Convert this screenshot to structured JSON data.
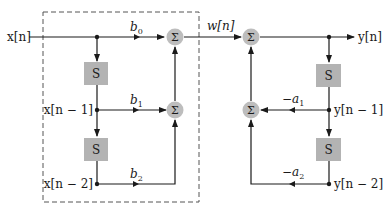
{
  "diagram": {
    "type": "direct-form-I-biquad",
    "colors": {
      "line": "#1a1a1a",
      "block_fill": "#b3b3b3",
      "sum_fill": "#bdbdbd",
      "dashed_box": "#555555"
    },
    "input": {
      "label": "x[n]"
    },
    "intermediate": {
      "label": "w[n]"
    },
    "output": {
      "label": "y[n]"
    },
    "feedforward": {
      "taps": [
        {
          "signal": "x[n]",
          "gain": "b0"
        },
        {
          "signal": "x[n − 1]",
          "gain": "b1"
        },
        {
          "signal": "x[n − 2]",
          "gain": "b2"
        }
      ],
      "delays": [
        {
          "label": "S"
        },
        {
          "label": "S"
        }
      ],
      "adders": [
        {
          "label": "Σ"
        },
        {
          "label": "Σ"
        }
      ]
    },
    "feedback": {
      "taps": [
        {
          "signal": "y[n − 1]",
          "gain": "−a1"
        },
        {
          "signal": "y[n − 2]",
          "gain": "−a2"
        }
      ],
      "delays": [
        {
          "label": "S"
        },
        {
          "label": "S"
        }
      ],
      "adders": [
        {
          "label": "Σ"
        },
        {
          "label": "Σ"
        }
      ]
    },
    "text": {
      "x_n": "x[n]",
      "x_n1": "x[n − 1]",
      "x_n2": "x[n − 2]",
      "w_n": "w[n]",
      "y_n": "y[n]",
      "y_n1": "y[n − 1]",
      "y_n2": "y[n − 2]",
      "b0": "b",
      "b0_sub": "0",
      "b1": "b",
      "b1_sub": "1",
      "b2": "b",
      "b2_sub": "2",
      "a1": "−a",
      "a1_sub": "1",
      "a2": "−a",
      "a2_sub": "2",
      "S": "S",
      "sigma": "Σ"
    }
  }
}
